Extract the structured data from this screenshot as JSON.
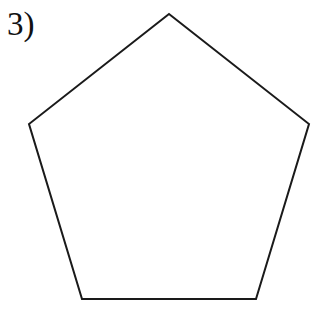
{
  "problem": {
    "label": "3)"
  },
  "figure": {
    "shape": "pentagon",
    "stroke_color": "#1a1a1a",
    "fill_color": "#ffffff",
    "stroke_width": 2,
    "points": "169,14 309,124 256,299 82,299 29,124"
  }
}
